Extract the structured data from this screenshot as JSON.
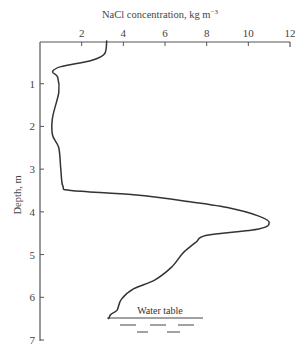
{
  "chart_data": {
    "type": "line",
    "xlabel": "NaCl concentration, kg m⁻³",
    "ylabel": "Depth, m",
    "x_axis_position": "top",
    "y_axis_inverted": true,
    "xlim": [
      0,
      12
    ],
    "ylim": [
      0,
      7
    ],
    "xticks": [
      2,
      4,
      6,
      8,
      10,
      12
    ],
    "yticks": [
      1,
      2,
      3,
      4,
      5,
      6,
      7
    ],
    "grid": false,
    "legend": null,
    "series": [
      {
        "name": "NaCl concentration profile",
        "points": [
          [
            3.2,
            0.0
          ],
          [
            3.1,
            0.3
          ],
          [
            2.5,
            0.45
          ],
          [
            1.0,
            0.6
          ],
          [
            0.6,
            0.72
          ],
          [
            0.85,
            0.85
          ],
          [
            0.9,
            1.2
          ],
          [
            0.6,
            1.8
          ],
          [
            0.6,
            2.2
          ],
          [
            0.9,
            2.5
          ],
          [
            1.0,
            3.0
          ],
          [
            1.1,
            3.4
          ],
          [
            1.5,
            3.5
          ],
          [
            4.5,
            3.6
          ],
          [
            7.0,
            3.75
          ],
          [
            9.0,
            3.9
          ],
          [
            10.5,
            4.1
          ],
          [
            11.0,
            4.25
          ],
          [
            10.5,
            4.4
          ],
          [
            8.0,
            4.55
          ],
          [
            7.5,
            4.7
          ],
          [
            7.0,
            4.9
          ],
          [
            6.8,
            5.0
          ],
          [
            6.3,
            5.3
          ],
          [
            5.5,
            5.6
          ],
          [
            4.5,
            5.8
          ],
          [
            3.9,
            6.05
          ],
          [
            3.7,
            6.3
          ],
          [
            3.4,
            6.4
          ],
          [
            3.3,
            6.5
          ]
        ]
      }
    ],
    "annotations": [
      {
        "text": "Water table",
        "depth": 6.5,
        "x_range": [
          3.2,
          7.8
        ]
      }
    ]
  },
  "labels": {
    "x_title": "NaCl concentration, kg m",
    "x_title_sup": "−3",
    "y_title": "Depth, m",
    "water_table": "Water table",
    "xtick_labels": [
      "2",
      "4",
      "6",
      "8",
      "10",
      "12"
    ],
    "ytick_labels": [
      "1",
      "2",
      "3",
      "4",
      "5",
      "6",
      "7"
    ]
  },
  "colors": {
    "line": "#333333",
    "axis": "#555555"
  }
}
